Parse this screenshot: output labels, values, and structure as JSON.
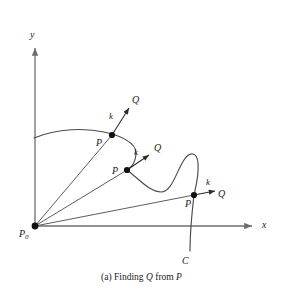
{
  "figure": {
    "caption_prefix": "(a) Finding",
    "caption_mid": "from",
    "caption_q": "Q",
    "caption_p": "P",
    "caption_full": "(a) Finding Q from P"
  },
  "axes": {
    "y_label": "y",
    "x_label": "x",
    "origin_label": "P",
    "origin_subscript": "0",
    "color": "#6e6e6e",
    "origin": {
      "x": 35,
      "y": 226
    },
    "x_axis_end": {
      "x": 255,
      "y": 226
    },
    "y_axis_top": {
      "x": 35,
      "y": 45
    }
  },
  "curve": {
    "name_label": "C",
    "color": "#4a4a4a",
    "start": {
      "x": 34,
      "y": 138
    },
    "end": {
      "x": 190,
      "y": 251
    }
  },
  "points": [
    {
      "p_label": "P",
      "k_label": "k",
      "q_label": "Q",
      "point": {
        "x": 112,
        "y": 135
      },
      "arrow_tip": {
        "x": 131,
        "y": 105
      },
      "p_label_pos": {
        "x": 98,
        "y": 133
      },
      "k_label_pos": {
        "x": 110,
        "y": 113
      },
      "q_label_pos": {
        "x": 133,
        "y": 96
      }
    },
    {
      "p_label": "P",
      "k_label": "k",
      "q_label": "Q",
      "point": {
        "x": 127,
        "y": 170
      },
      "arrow_tip": {
        "x": 151,
        "y": 153
      },
      "p_label_pos": {
        "x": 113,
        "y": 168
      },
      "k_label_pos": {
        "x": 135,
        "y": 148
      },
      "q_label_pos": {
        "x": 155,
        "y": 144
      }
    },
    {
      "p_label": "P",
      "k_label": "k",
      "q_label": "Q",
      "point": {
        "x": 194,
        "y": 195
      },
      "arrow_tip": {
        "x": 216,
        "y": 190
      },
      "p_label_pos": {
        "x": 186,
        "y": 200
      },
      "k_label_pos": {
        "x": 207,
        "y": 179
      },
      "q_label_pos": {
        "x": 219,
        "y": 190
      }
    }
  ],
  "rays": [
    {
      "from": {
        "x": 35,
        "y": 226
      },
      "to": {
        "x": 112,
        "y": 135
      }
    },
    {
      "from": {
        "x": 35,
        "y": 226
      },
      "to": {
        "x": 127,
        "y": 170
      }
    },
    {
      "from": {
        "x": 35,
        "y": 226
      },
      "to": {
        "x": 194,
        "y": 195
      }
    }
  ],
  "colors": {
    "ink": "#1a1a1a",
    "axis": "#6e6e6e",
    "curve": "#4a4a4a",
    "background": "#ffffff"
  }
}
